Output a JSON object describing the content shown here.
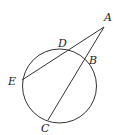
{
  "diagram": {
    "type": "circle-with-secants",
    "circle": {
      "cx": 59.5,
      "cy": 86,
      "r": 37
    },
    "points": {
      "A": {
        "x": 104,
        "y": 27,
        "label": "A",
        "lx": 104,
        "ly": 21
      },
      "D": {
        "x": 67,
        "y": 50,
        "label": "D",
        "lx": 58,
        "ly": 47
      },
      "B": {
        "x": 87,
        "y": 60,
        "label": "B",
        "lx": 89,
        "ly": 64
      },
      "E": {
        "x": 22,
        "y": 80,
        "label": "E",
        "lx": 8,
        "ly": 85
      },
      "C": {
        "x": 48,
        "y": 120,
        "label": "C",
        "lx": 41,
        "ly": 132
      }
    },
    "segments": [
      {
        "from": "A",
        "to": "E",
        "name": "secant-AE"
      },
      {
        "from": "A",
        "to": "C",
        "name": "secant-AC"
      }
    ],
    "colors": {
      "stroke": "#333333",
      "label": "#222222"
    }
  }
}
